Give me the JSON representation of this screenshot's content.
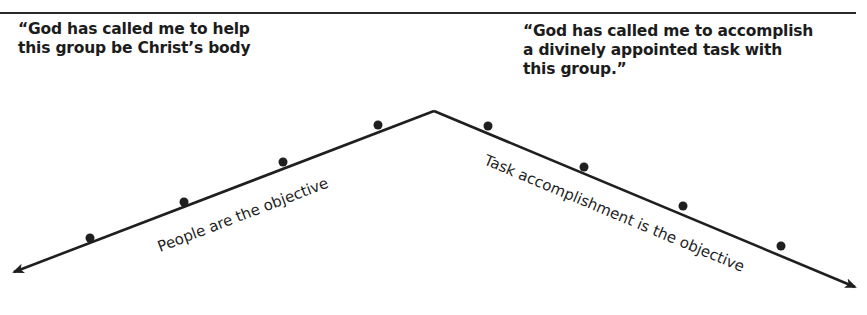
{
  "quotes": {
    "left": {
      "lines": [
        "“God has called me to help",
        "this group be Christ’s body"
      ]
    },
    "right": {
      "lines": [
        "“God has called me to accomplish",
        "a divinely appointed task with",
        "this group.”"
      ]
    }
  },
  "diagram": {
    "apex": {
      "x": 434,
      "y": 111
    },
    "left_arrow": {
      "tip": {
        "x": 14,
        "y": 272
      },
      "label": "People are the objective",
      "dots": [
        {
          "x": 90,
          "y": 240
        },
        {
          "x": 184,
          "y": 204
        },
        {
          "x": 283,
          "y": 164
        },
        {
          "x": 378,
          "y": 127
        }
      ]
    },
    "right_arrow": {
      "tip": {
        "x": 855,
        "y": 287
      },
      "label": "Task accomplishment is the objective",
      "dots": [
        {
          "x": 488,
          "y": 128
        },
        {
          "x": 584,
          "y": 169
        },
        {
          "x": 683,
          "y": 208
        },
        {
          "x": 781,
          "y": 248
        }
      ]
    },
    "line_color": "#1f1f1f"
  }
}
